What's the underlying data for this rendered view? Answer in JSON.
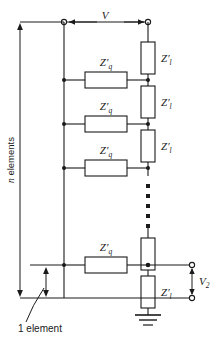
{
  "figure": {
    "type": "ladder-network-circuit",
    "background_color": "#ffffff",
    "line_color": "#1a1a1a"
  },
  "labels": {
    "input_voltage": "V",
    "output_voltage": "V",
    "output_voltage_sub": "2",
    "series_impedance": "Z",
    "series_impedance_prime": "′",
    "series_impedance_sub": "q",
    "shunt_impedance": "Z",
    "shunt_impedance_prime": "′",
    "shunt_impedance_sub": "l",
    "n_elements": "n elements",
    "n_elements_italic": "n",
    "n_elements_rest": " elements",
    "one_element": "1 element"
  },
  "series_elements": [
    {
      "label": "Z",
      "prime": "′",
      "sub": "q",
      "row": 1
    },
    {
      "label": "Z",
      "prime": "′",
      "sub": "q",
      "row": 2
    },
    {
      "label": "Z",
      "prime": "′",
      "sub": "q",
      "row": 3
    },
    {
      "label": "Z",
      "prime": "′",
      "sub": "q",
      "row": 4
    }
  ],
  "shunt_elements": [
    {
      "label": "Z",
      "prime": "′",
      "sub": "l",
      "row": 1
    },
    {
      "label": "Z",
      "prime": "′",
      "sub": "l",
      "row": 2
    },
    {
      "label": "Z",
      "prime": "′",
      "sub": "l",
      "row": 3
    },
    {
      "label": "Z",
      "prime": "′",
      "sub": "l",
      "row": 4
    }
  ],
  "annotations": {
    "ellipsis_dots": 5,
    "ground_symbol": "earth-ground",
    "terminals": 4
  }
}
